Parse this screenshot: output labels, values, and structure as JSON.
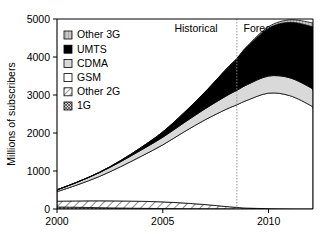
{
  "chart_data": {
    "type": "area",
    "title": "",
    "subtitle": "",
    "xlabel": "",
    "ylabel": "Millions of subscribers",
    "xlim": [
      2000,
      2012.1
    ],
    "ylim": [
      0,
      5000
    ],
    "grid": false,
    "stacked": true,
    "legend_position": "top-left inside",
    "x": [
      2000,
      2001,
      2002,
      2003,
      2004,
      2005,
      2006,
      2007,
      2008,
      2008.5,
      2009,
      2010,
      2011,
      2012,
      2012.1
    ],
    "y_ticks": [
      0,
      1000,
      2000,
      3000,
      4000,
      5000
    ],
    "y_tick_labels": [
      "0",
      "1000",
      "2000",
      "3000",
      "4000",
      "5000"
    ],
    "x_ticks": [
      2000,
      2005,
      2010
    ],
    "x_tick_labels": [
      "2000",
      "2005",
      "2010"
    ],
    "stack_order_bottom_to_top": [
      "1G",
      "Other 2G",
      "GSM",
      "CDMA",
      "UMTS",
      "Other 3G"
    ],
    "series": [
      {
        "name": "1G",
        "fill": "#d9d9d9",
        "pattern": "crosshatch",
        "values": [
          55,
          45,
          35,
          26,
          18,
          12,
          8,
          5,
          3,
          2,
          2,
          1,
          0,
          0,
          0
        ]
      },
      {
        "name": "Other 2G",
        "fill": "#ffffff",
        "pattern": "diagonal-hatch",
        "values": [
          150,
          168,
          180,
          186,
          185,
          176,
          150,
          112,
          62,
          40,
          22,
          8,
          3,
          0,
          0
        ]
      },
      {
        "name": "GSM",
        "fill": "#ffffff",
        "pattern": "solid",
        "values": [
          250,
          430,
          640,
          900,
          1190,
          1500,
          1870,
          2230,
          2560,
          2700,
          2840,
          3040,
          2980,
          2720,
          2640
        ]
      },
      {
        "name": "CDMA",
        "fill": "#d9d9d9",
        "pattern": "solid",
        "values": [
          48,
          72,
          100,
          130,
          165,
          200,
          240,
          290,
          350,
          380,
          410,
          450,
          470,
          470,
          470
        ]
      },
      {
        "name": "UMTS",
        "fill": "#000000",
        "pattern": "solid",
        "values": [
          1,
          3,
          10,
          30,
          70,
          140,
          260,
          440,
          700,
          830,
          1000,
          1260,
          1460,
          1620,
          1660
        ]
      },
      {
        "name": "Other 3G",
        "fill": "#9e9e9e",
        "pattern": "vertical-hatch",
        "values": [
          0,
          0,
          0,
          0,
          1,
          2,
          4,
          7,
          12,
          16,
          22,
          40,
          65,
          95,
          105
        ]
      }
    ],
    "annotations": [
      {
        "name": "historical-label",
        "text": "Historical",
        "x": 2005.6,
        "y": 4800
      },
      {
        "name": "forecast-label",
        "text": "Forecast",
        "x": 2009.9,
        "y": 4800
      },
      {
        "name": "era-divider",
        "text": "",
        "x": 2008.5,
        "style": "dotted-vertical"
      }
    ],
    "legend_entries": [
      {
        "label": "Other 3G",
        "swatch": "vertical-hatch",
        "fill": "#9e9e9e"
      },
      {
        "label": "UMTS",
        "swatch": "solid",
        "fill": "#000000"
      },
      {
        "label": "CDMA",
        "swatch": "solid",
        "fill": "#d9d9d9"
      },
      {
        "label": "GSM",
        "swatch": "solid",
        "fill": "#ffffff"
      },
      {
        "label": "Other 2G",
        "swatch": "diagonal-hatch",
        "fill": "#ffffff"
      },
      {
        "label": "1G",
        "swatch": "crosshatch",
        "fill": "#d9d9d9"
      }
    ]
  },
  "colors": {
    "axis": "#000000",
    "divider": "#8a8a8a",
    "umts": "#000000",
    "cdma": "#d9d9d9",
    "other3g": "#9e9e9e",
    "gsm": "#ffffff",
    "background": "#ffffff"
  }
}
